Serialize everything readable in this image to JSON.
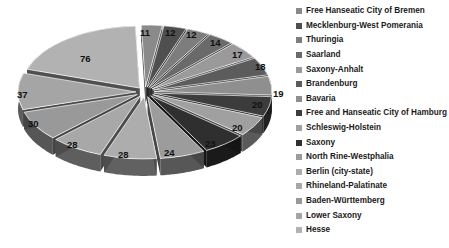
{
  "chart_data": {
    "type": "pie",
    "title": "",
    "subtitle": "",
    "xlabel": "",
    "ylabel": "",
    "exploded": true,
    "three_d": true,
    "grid": false,
    "legend_position": "right",
    "categories": [
      "Free Hanseatic City of Bremen",
      "Mecklenburg-West Pomerania",
      "Thuringia",
      "Saarland",
      "Saxony-Anhalt",
      "Brandenburg",
      "Bavaria",
      "Free and Hanseatic City of Hamburg",
      "Schleswig-Holstein",
      "Saxony",
      "North Rine-Westphalia",
      "Berlin (city-state)",
      "Rhineland-Palatinate",
      "Baden-Württemberg",
      "Lower Saxony",
      "Hesse"
    ],
    "values": [
      11,
      12,
      12,
      14,
      17,
      18,
      19,
      20,
      20,
      23,
      24,
      28,
      28,
      30,
      37,
      76
    ],
    "slice_colors": [
      "#8a8a8a",
      "#4f4f4f",
      "#7d7d7d",
      "#6a6a6a",
      "#9a9a9a",
      "#5c5c5c",
      "#8f8f8f",
      "#3c3c3c",
      "#a0a0a0",
      "#2f2f2f",
      "#9c9c9c",
      "#adadad",
      "#a8a8a8",
      "#999999",
      "#a5a5a5",
      "#b2b2b2"
    ],
    "data_labels": [
      {
        "value": "11",
        "x": 140,
        "y": 28
      },
      {
        "value": "12",
        "x": 165,
        "y": 28
      },
      {
        "value": "12",
        "x": 186,
        "y": 30
      },
      {
        "value": "14",
        "x": 210,
        "y": 38
      },
      {
        "value": "17",
        "x": 232,
        "y": 50
      },
      {
        "value": "18",
        "x": 255,
        "y": 62
      },
      {
        "value": "19",
        "x": 273,
        "y": 89
      },
      {
        "value": "20",
        "x": 252,
        "y": 100
      },
      {
        "value": "20",
        "x": 232,
        "y": 123
      },
      {
        "value": "23",
        "x": 205,
        "y": 139
      },
      {
        "value": "24",
        "x": 164,
        "y": 148
      },
      {
        "value": "28",
        "x": 118,
        "y": 150
      },
      {
        "value": "28",
        "x": 67,
        "y": 140
      },
      {
        "value": "30",
        "x": 28,
        "y": 119
      },
      {
        "value": "37",
        "x": 17,
        "y": 90
      },
      {
        "value": "76",
        "x": 80,
        "y": 54
      }
    ]
  },
  "legend": {
    "items": [
      {
        "label": "Free Hanseatic City of Bremen",
        "color": "#8a8a8a"
      },
      {
        "label": "Mecklenburg-West Pomerania",
        "color": "#4f4f4f"
      },
      {
        "label": "Thuringia",
        "color": "#7d7d7d"
      },
      {
        "label": "Saarland",
        "color": "#6a6a6a"
      },
      {
        "label": "Saxony-Anhalt",
        "color": "#9a9a9a"
      },
      {
        "label": "Brandenburg",
        "color": "#5c5c5c"
      },
      {
        "label": "Bavaria",
        "color": "#8f8f8f"
      },
      {
        "label": "Free and Hanseatic City of Hamburg",
        "color": "#3c3c3c"
      },
      {
        "label": "Schleswig-Holstein",
        "color": "#a0a0a0"
      },
      {
        "label": "Saxony",
        "color": "#2f2f2f"
      },
      {
        "label": "North Rine-Westphalia",
        "color": "#9c9c9c"
      },
      {
        "label": "Berlin (city-state)",
        "color": "#adadad"
      },
      {
        "label": "Rhineland-Palatinate",
        "color": "#a8a8a8"
      },
      {
        "label": "Baden-Württemberg",
        "color": "#999999"
      },
      {
        "label": "Lower Saxony",
        "color": "#a5a5a5"
      },
      {
        "label": "Hesse",
        "color": "#b2b2b2"
      }
    ]
  }
}
